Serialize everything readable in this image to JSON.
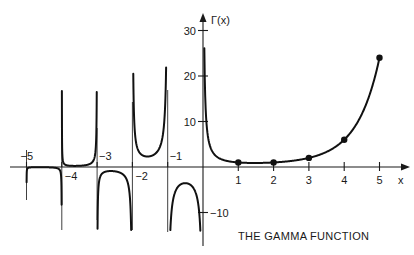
{
  "chart_data": {
    "type": "line",
    "title": "THE GAMMA FUNCTION",
    "xlabel": "x",
    "ylabel": "Γ(x)",
    "xlim": [
      -5.3,
      5.7
    ],
    "ylim": [
      -14,
      33
    ],
    "grid": false,
    "legend": null,
    "x_ticks": [
      {
        "value": -5,
        "label": "−5"
      },
      {
        "value": -4,
        "label": "−4"
      },
      {
        "value": -3,
        "label": "−3"
      },
      {
        "value": -2,
        "label": "−2"
      },
      {
        "value": -1,
        "label": "−1"
      },
      {
        "value": 1,
        "label": "1"
      },
      {
        "value": 2,
        "label": "2"
      },
      {
        "value": 3,
        "label": "3"
      },
      {
        "value": 4,
        "label": "4"
      },
      {
        "value": 5,
        "label": "5"
      }
    ],
    "y_ticks": [
      {
        "value": 30,
        "label": "30"
      },
      {
        "value": 20,
        "label": "20"
      },
      {
        "value": 10,
        "label": "10"
      },
      {
        "value": -10,
        "label": "−10"
      }
    ],
    "vertical_asymptotes": [
      -5,
      -4,
      -3,
      -2,
      -1,
      0
    ],
    "series": [
      {
        "name": "Γ(x)",
        "function": "gamma",
        "branches": [
          {
            "interval": [
              -5,
              -4
            ],
            "clip_y": [
              -14,
              22
            ],
            "note": "negative branch, max ≈ -0.0027"
          },
          {
            "interval": [
              -4,
              -3
            ],
            "clip_y": [
              -14,
              22
            ],
            "note": "positive branch, min ≈ 0.0095"
          },
          {
            "interval": [
              -3,
              -2
            ],
            "clip_y": [
              -14,
              22
            ],
            "note": "negative branch, max ≈ -0.0324"
          },
          {
            "interval": [
              -2,
              -1
            ],
            "clip_y": [
              -14,
              22
            ],
            "note": "positive branch, min ≈ 2.3"
          },
          {
            "interval": [
              -1,
              0
            ],
            "clip_y": [
              -14,
              22
            ],
            "note": "negative branch, max ≈ -3.54"
          },
          {
            "interval": [
              0,
              5
            ],
            "clip_y": [
              -14,
              33
            ],
            "note": "positive branch, min ≈ 0.886 at x≈1.46"
          }
        ]
      }
    ],
    "marked_points": [
      {
        "x": 1,
        "y": 1
      },
      {
        "x": 2,
        "y": 1
      },
      {
        "x": 3,
        "y": 2
      },
      {
        "x": 4,
        "y": 6
      },
      {
        "x": 5,
        "y": 24
      }
    ],
    "annotations": [
      {
        "text": "THE GAMMA FUNCTION",
        "position": "lower right"
      }
    ]
  }
}
